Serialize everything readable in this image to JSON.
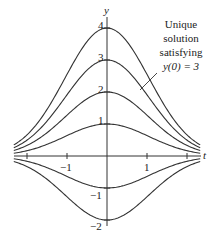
{
  "figure": {
    "axes": {
      "x_label": "t",
      "y_label": "y",
      "x_ticks": [
        {
          "value": -2,
          "label": ""
        },
        {
          "value": -1,
          "label": "−1"
        },
        {
          "value": 1,
          "label": "1"
        },
        {
          "value": 2,
          "label": ""
        }
      ],
      "y_ticks": [
        {
          "value": 4,
          "label": "4"
        },
        {
          "value": 3,
          "label": "3"
        },
        {
          "value": 2,
          "label": "2"
        },
        {
          "value": 1,
          "label": "1"
        },
        {
          "value": -1,
          "label": "−1"
        },
        {
          "value": -2,
          "label": "−2"
        }
      ]
    },
    "curves": {
      "description": "Solution curves y = y0·e^(−k t²)",
      "initial_values": [
        4,
        3,
        2,
        1,
        -1,
        -2
      ],
      "decay_k": 0.45,
      "t_range": [
        -2.33,
        2.33
      ]
    },
    "annotation": {
      "line1": "Unique",
      "line2": "solution",
      "line3": "satisfying",
      "line4": "y(0) = 3"
    },
    "colors": {
      "curve": "#333333",
      "axis": "#333333",
      "text": "#222222"
    }
  }
}
